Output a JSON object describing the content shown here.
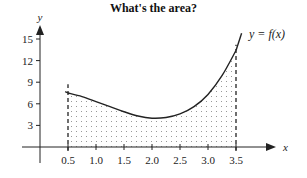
{
  "chart_data": {
    "type": "area",
    "title": "What's the area?",
    "xlabel": "x",
    "ylabel": "y",
    "curve_label": "y = f(x)",
    "x_ticks": [
      0.5,
      1.0,
      1.5,
      2.0,
      2.5,
      3.0,
      3.5
    ],
    "x_tick_labels": [
      "0.5",
      "1.0",
      "1.5",
      "2.0",
      "2.5",
      "3.0",
      "3.5"
    ],
    "y_ticks": [
      3,
      6,
      9,
      12,
      15
    ],
    "y_tick_labels": [
      "3",
      "6",
      "9",
      "12",
      "15"
    ],
    "xlim": [
      0,
      4.2
    ],
    "ylim": [
      0,
      16.5
    ],
    "grid": false,
    "legend": "none",
    "shaded_region": {
      "from_x": 0.5,
      "to_x": 3.5,
      "pattern": "dotted",
      "bounds": "dashed vertical lines"
    },
    "series": [
      {
        "name": "f(x)",
        "x": [
          0.5,
          0.75,
          1.0,
          1.25,
          1.5,
          1.75,
          2.0,
          2.25,
          2.5,
          2.75,
          3.0,
          3.25,
          3.5
        ],
        "values": [
          7.5,
          7.0,
          6.3,
          5.6,
          4.9,
          4.3,
          4.0,
          4.1,
          4.6,
          5.6,
          7.3,
          9.9,
          13.4
        ]
      }
    ]
  },
  "colors": {
    "axis": "#222222",
    "curve": "#222222",
    "dots": "#666666",
    "background": "#ffffff"
  }
}
